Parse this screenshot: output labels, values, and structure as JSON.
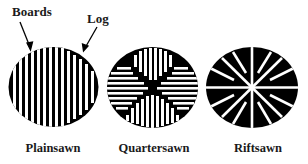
{
  "diagram": {
    "callouts": {
      "boards": "Boards",
      "log": "Log"
    },
    "captions": {
      "plainsawn": "Plainsawn",
      "quartersawn": "Quartersawn",
      "riftsawn": "Riftsawn"
    },
    "colors": {
      "ink": "#000000",
      "paper": "#ffffff",
      "text": "#1a1a1a"
    }
  }
}
